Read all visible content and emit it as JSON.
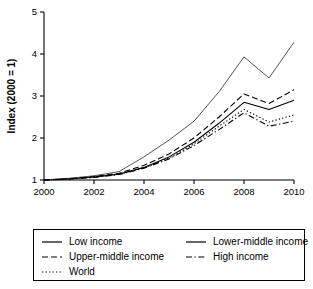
{
  "chart_data": {
    "type": "line",
    "title": "",
    "xlabel": "year",
    "ylabel": "Index (2000 = 1)",
    "xlim": [
      2000,
      2010
    ],
    "ylim": [
      1,
      5
    ],
    "grid": false,
    "legend_position": "bottom",
    "x": [
      2000,
      2001,
      2002,
      2003,
      2004,
      2005,
      2006,
      2007,
      2008,
      2009,
      2010
    ],
    "xticks": [
      "2000",
      "2002",
      "2004",
      "2006",
      "2008",
      "2010"
    ],
    "xtick_values": [
      2000,
      2002,
      2004,
      2006,
      2008,
      2010
    ],
    "yticks": [
      "1",
      "2",
      "3",
      "4",
      "5"
    ],
    "ytick_values": [
      1,
      2,
      3,
      4,
      5
    ],
    "series": [
      {
        "name": "Low income",
        "style": "solid",
        "color": "#000000",
        "values": [
          1.0,
          1.03,
          1.07,
          1.14,
          1.3,
          1.55,
          1.9,
          2.35,
          2.85,
          2.68,
          2.9
        ]
      },
      {
        "name": "Lower-middle income",
        "style": "solid",
        "color": "#555555",
        "values": [
          1.0,
          1.04,
          1.1,
          1.2,
          1.55,
          1.95,
          2.4,
          3.1,
          3.93,
          3.43,
          4.28
        ]
      },
      {
        "name": "Upper-middle income",
        "style": "dashed",
        "color": "#000000",
        "values": [
          1.0,
          1.03,
          1.08,
          1.16,
          1.35,
          1.62,
          2.0,
          2.5,
          3.05,
          2.82,
          3.15
        ]
      },
      {
        "name": "High income",
        "style": "dashdot",
        "color": "#000000",
        "values": [
          1.0,
          1.02,
          1.06,
          1.13,
          1.28,
          1.5,
          1.82,
          2.2,
          2.6,
          2.28,
          2.4
        ]
      },
      {
        "name": "World",
        "style": "dotted",
        "color": "#000000",
        "values": [
          1.0,
          1.02,
          1.07,
          1.14,
          1.29,
          1.52,
          1.86,
          2.28,
          2.68,
          2.38,
          2.55
        ]
      }
    ]
  },
  "axes": {
    "ylabel": "Index (2000 = 1)",
    "xlabel": "year",
    "xticks": [
      "2000",
      "2002",
      "2004",
      "2006",
      "2008",
      "2010"
    ],
    "yticks": [
      "5",
      "4",
      "3",
      "2",
      "1"
    ]
  },
  "legend": {
    "entries": [
      {
        "label": "Low income",
        "style": "solid"
      },
      {
        "label": "Lower-middle income",
        "style": "solid"
      },
      {
        "label": "Upper-middle income",
        "style": "dashed"
      },
      {
        "label": "High income",
        "style": "dashdot"
      },
      {
        "label": "World",
        "style": "dotted"
      }
    ]
  }
}
